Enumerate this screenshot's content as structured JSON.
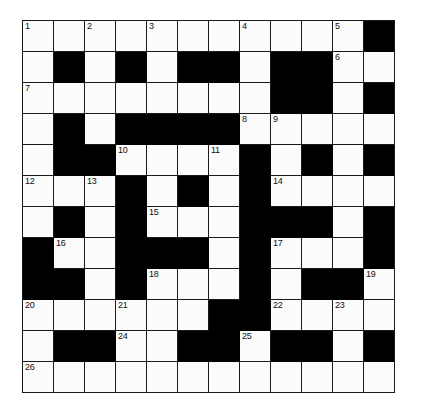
{
  "puzzle": {
    "title": "Crossword Grid",
    "rows": 12,
    "cols": 12,
    "cell_size_px": 30,
    "colors": {
      "block": "#000000",
      "cell": "#fbfbfb",
      "border": "#1a1a1a",
      "number_text": "#111111",
      "page_background": "#ffffff"
    },
    "legend": {
      "W": "open/white letter cell",
      "B": "blocked/black cell"
    },
    "grid": [
      [
        "W",
        "W",
        "W",
        "W",
        "W",
        "W",
        "W",
        "W",
        "W",
        "W",
        "W",
        "B"
      ],
      [
        "W",
        "B",
        "W",
        "B",
        "W",
        "B",
        "B",
        "W",
        "B",
        "B",
        "W",
        "W"
      ],
      [
        "W",
        "W",
        "W",
        "W",
        "W",
        "W",
        "W",
        "W",
        "B",
        "B",
        "W",
        "B"
      ],
      [
        "W",
        "B",
        "W",
        "B",
        "B",
        "B",
        "B",
        "W",
        "W",
        "W",
        "W",
        "W"
      ],
      [
        "W",
        "B",
        "B",
        "W",
        "W",
        "W",
        "W",
        "B",
        "W",
        "B",
        "W",
        "B"
      ],
      [
        "W",
        "W",
        "W",
        "B",
        "W",
        "B",
        "W",
        "B",
        "W",
        "W",
        "W",
        "W"
      ],
      [
        "W",
        "B",
        "W",
        "B",
        "W",
        "W",
        "W",
        "B",
        "B",
        "B",
        "W",
        "B"
      ],
      [
        "B",
        "W",
        "W",
        "B",
        "B",
        "B",
        "W",
        "B",
        "W",
        "W",
        "W",
        "B"
      ],
      [
        "B",
        "B",
        "W",
        "B",
        "W",
        "W",
        "W",
        "B",
        "W",
        "B",
        "B",
        "W"
      ],
      [
        "W",
        "W",
        "W",
        "W",
        "W",
        "W",
        "B",
        "B",
        "W",
        "W",
        "W",
        "W"
      ],
      [
        "W",
        "B",
        "B",
        "W",
        "W",
        "B",
        "B",
        "W",
        "B",
        "B",
        "W",
        "B"
      ],
      [
        "W",
        "W",
        "W",
        "W",
        "W",
        "W",
        "W",
        "W",
        "W",
        "W",
        "W",
        "W"
      ]
    ],
    "numbers": [
      {
        "n": 1,
        "row": 1,
        "col": 1
      },
      {
        "n": 2,
        "row": 1,
        "col": 3
      },
      {
        "n": 3,
        "row": 1,
        "col": 5
      },
      {
        "n": 4,
        "row": 1,
        "col": 8
      },
      {
        "n": 5,
        "row": 1,
        "col": 11
      },
      {
        "n": 6,
        "row": 2,
        "col": 11
      },
      {
        "n": 7,
        "row": 3,
        "col": 1
      },
      {
        "n": 8,
        "row": 4,
        "col": 8
      },
      {
        "n": 9,
        "row": 4,
        "col": 9
      },
      {
        "n": 10,
        "row": 5,
        "col": 4
      },
      {
        "n": 11,
        "row": 5,
        "col": 7
      },
      {
        "n": 12,
        "row": 6,
        "col": 1
      },
      {
        "n": 13,
        "row": 6,
        "col": 3
      },
      {
        "n": 14,
        "row": 6,
        "col": 9
      },
      {
        "n": 15,
        "row": 7,
        "col": 5
      },
      {
        "n": 16,
        "row": 8,
        "col": 2
      },
      {
        "n": 17,
        "row": 8,
        "col": 9
      },
      {
        "n": 18,
        "row": 9,
        "col": 5
      },
      {
        "n": 19,
        "row": 9,
        "col": 12
      },
      {
        "n": 20,
        "row": 10,
        "col": 1
      },
      {
        "n": 21,
        "row": 10,
        "col": 4
      },
      {
        "n": 22,
        "row": 10,
        "col": 9
      },
      {
        "n": 23,
        "row": 10,
        "col": 11
      },
      {
        "n": 24,
        "row": 11,
        "col": 4
      },
      {
        "n": 25,
        "row": 11,
        "col": 8
      },
      {
        "n": 26,
        "row": 12,
        "col": 1
      }
    ]
  }
}
